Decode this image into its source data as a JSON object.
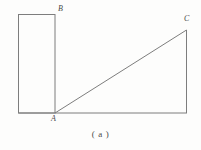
{
  "figure": {
    "caption": "( a )",
    "background_color": "#fdfdfc",
    "stroke_color": "#7d7d7d",
    "label_color": "#4a4a4a",
    "stroke_width": 1,
    "width": 201,
    "height": 150,
    "labels": {
      "b": "B",
      "a": "A",
      "c": "C"
    },
    "shapes": {
      "rectangle": {
        "name": "vertical-rectangle",
        "x": 18,
        "y": 14,
        "width": 37,
        "height": 99
      },
      "triangle": {
        "name": "right-triangle",
        "points": "55,113 186,30 186,113"
      },
      "baseline": {
        "name": "horizontal-baseline",
        "x1": 18,
        "y1": 113,
        "x2": 187,
        "y2": 113
      }
    }
  }
}
